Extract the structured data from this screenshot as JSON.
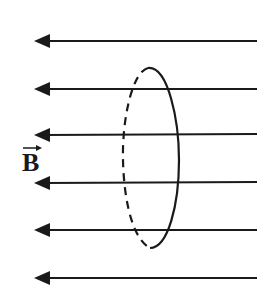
{
  "diagram": {
    "title": "",
    "field_label": "B",
    "field_label_has_vector_arrow": true,
    "field_direction": "left",
    "field_line_count": 6,
    "field_line_y": [
      41,
      89,
      135,
      183,
      230,
      278
    ],
    "loop": {
      "shape": "ellipse",
      "front_edge": "solid",
      "back_edge": "dashed"
    },
    "colors": {
      "line": "#1a1a1a",
      "background": "#ffffff"
    }
  }
}
